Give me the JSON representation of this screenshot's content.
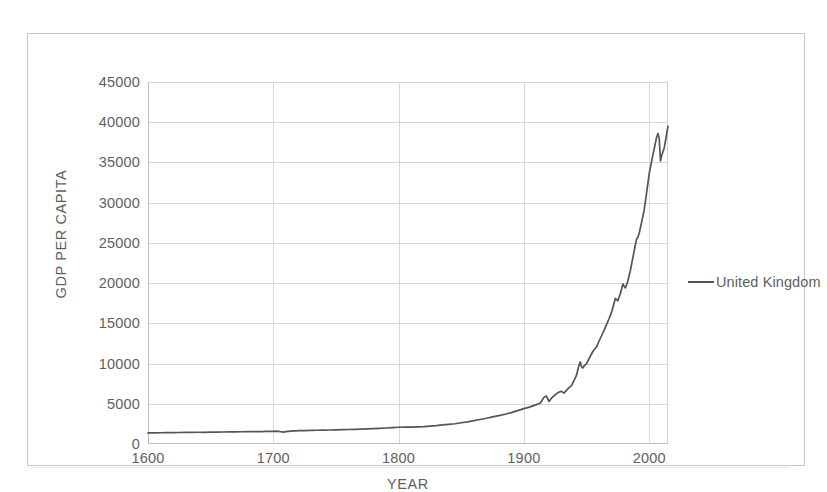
{
  "chart_data": {
    "type": "line",
    "title": "",
    "xlabel": "YEAR",
    "ylabel": "GDP PER CAPITA",
    "xlim": [
      1600,
      2015
    ],
    "ylim": [
      0,
      45000
    ],
    "grid": true,
    "legend_position": "right",
    "line_color": "#555555",
    "gridline_color": "#d8d8d8",
    "x_ticks": [
      {
        "value": 1600,
        "label": "1600"
      },
      {
        "value": 1700,
        "label": "1700"
      },
      {
        "value": 1800,
        "label": "1800"
      },
      {
        "value": 1900,
        "label": "1900"
      },
      {
        "value": 2000,
        "label": "2000"
      }
    ],
    "y_ticks": [
      {
        "value": 45000,
        "label": "45000"
      },
      {
        "value": 40000,
        "label": "40000"
      },
      {
        "value": 35000,
        "label": "35000"
      },
      {
        "value": 30000,
        "label": "30000"
      },
      {
        "value": 25000,
        "label": "25000"
      },
      {
        "value": 20000,
        "label": "20000"
      },
      {
        "value": 15000,
        "label": "15000"
      },
      {
        "value": 10000,
        "label": "10000"
      },
      {
        "value": 5000,
        "label": "5000"
      },
      {
        "value": 0,
        "label": "0"
      }
    ],
    "series": [
      {
        "name": "United Kingdom",
        "color": "#555555",
        "x": [
          1600,
          1605,
          1610,
          1615,
          1620,
          1625,
          1630,
          1635,
          1640,
          1645,
          1650,
          1655,
          1660,
          1665,
          1670,
          1675,
          1680,
          1685,
          1690,
          1695,
          1700,
          1702,
          1704,
          1706,
          1708,
          1710,
          1712,
          1714,
          1716,
          1718,
          1720,
          1725,
          1730,
          1735,
          1740,
          1745,
          1750,
          1755,
          1760,
          1765,
          1770,
          1775,
          1780,
          1785,
          1790,
          1795,
          1800,
          1805,
          1810,
          1815,
          1820,
          1825,
          1830,
          1835,
          1840,
          1845,
          1850,
          1855,
          1860,
          1865,
          1870,
          1875,
          1880,
          1885,
          1890,
          1895,
          1900,
          1905,
          1910,
          1913,
          1916,
          1918,
          1919,
          1920,
          1921,
          1922,
          1924,
          1926,
          1928,
          1930,
          1932,
          1934,
          1936,
          1938,
          1940,
          1942,
          1943,
          1944,
          1945,
          1946,
          1947,
          1948,
          1950,
          1952,
          1955,
          1958,
          1960,
          1963,
          1965,
          1968,
          1970,
          1973,
          1975,
          1977,
          1979,
          1980,
          1981,
          1983,
          1985,
          1987,
          1989,
          1990,
          1991,
          1992,
          1994,
          1996,
          1998,
          2000,
          2002,
          2004,
          2006,
          2007,
          2008,
          2009,
          2010,
          2012,
          2014,
          2015
        ],
        "y": [
          1380,
          1390,
          1400,
          1405,
          1420,
          1430,
          1440,
          1450,
          1460,
          1455,
          1470,
          1480,
          1490,
          1500,
          1510,
          1520,
          1530,
          1540,
          1550,
          1560,
          1570,
          1600,
          1560,
          1520,
          1480,
          1530,
          1570,
          1600,
          1620,
          1640,
          1660,
          1670,
          1700,
          1710,
          1730,
          1740,
          1760,
          1780,
          1800,
          1830,
          1860,
          1890,
          1920,
          1950,
          1990,
          2030,
          2080,
          2110,
          2090,
          2120,
          2150,
          2230,
          2290,
          2370,
          2450,
          2520,
          2640,
          2760,
          2900,
          3050,
          3200,
          3380,
          3530,
          3700,
          3900,
          4150,
          4400,
          4620,
          4900,
          5070,
          5800,
          5950,
          5650,
          5300,
          5450,
          5700,
          5980,
          6250,
          6450,
          6550,
          6320,
          6680,
          7000,
          7250,
          7900,
          8550,
          9200,
          9800,
          10200,
          9600,
          9450,
          9700,
          10000,
          10600,
          11500,
          12100,
          12800,
          13800,
          14500,
          15600,
          16400,
          18100,
          17800,
          18700,
          19900,
          19600,
          19400,
          20300,
          21600,
          23200,
          24800,
          25500,
          25700,
          26200,
          27600,
          29100,
          31300,
          33600,
          35200,
          36700,
          38200,
          38600,
          37900,
          35200,
          35900,
          36800,
          38600,
          39500
        ]
      }
    ]
  },
  "legend": {
    "entries": [
      {
        "label": "United Kingdom",
        "swatch": "line-swatch"
      }
    ]
  },
  "axis_titles": {
    "x": "YEAR",
    "y": "GDP PER CAPITA"
  }
}
